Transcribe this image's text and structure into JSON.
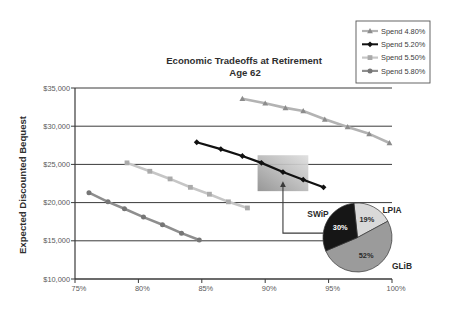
{
  "chart_data": {
    "type": "line",
    "title": "Economic Tradeoffs at Retirement",
    "subtitle": "Age 62",
    "xlabel": "",
    "ylabel": "Expected Discounted Bequest",
    "xlim": [
      75,
      100
    ],
    "ylim": [
      10000,
      35000
    ],
    "xticks": [
      75,
      80,
      85,
      90,
      95,
      100
    ],
    "xtick_labels": [
      "75%",
      "80%",
      "85%",
      "90%",
      "95%",
      "100%"
    ],
    "yticks": [
      10000,
      15000,
      20000,
      25000,
      30000,
      35000
    ],
    "ytick_labels": [
      "$10,000",
      "$15,000",
      "$20,000",
      "$25,000",
      "$30,000",
      "$35,000"
    ],
    "grid": "horizontal",
    "legend_position": "top-right",
    "series": [
      {
        "name": "Spend 4.80%",
        "color": "#b3b3b3",
        "marker_color": "#8c8c8c",
        "marker": "triangle",
        "x": [
          88.2,
          90.0,
          91.6,
          93.0,
          94.7,
          96.5,
          98.2,
          99.8
        ],
        "y": [
          33600,
          33000,
          32400,
          32000,
          30900,
          29900,
          29000,
          27800
        ]
      },
      {
        "name": "Spend 5.20%",
        "color": "#111111",
        "marker_color": "#111111",
        "marker": "diamond",
        "x": [
          84.6,
          86.5,
          88.2,
          89.7,
          91.4,
          93.0,
          94.6
        ],
        "y": [
          27900,
          27000,
          26100,
          25200,
          24000,
          23000,
          22000
        ]
      },
      {
        "name": "Spend 5.50%",
        "color": "#c6c6c6",
        "marker_color": "#aaaaaa",
        "marker": "square",
        "x": [
          79.1,
          80.9,
          82.5,
          84.1,
          85.6,
          87.1,
          88.6
        ],
        "y": [
          25200,
          24100,
          23100,
          22000,
          21100,
          20100,
          19300
        ]
      },
      {
        "name": "Spend 5.80%",
        "color": "#8e8e8e",
        "marker_color": "#767676",
        "marker": "circle",
        "x": [
          76.1,
          77.6,
          78.9,
          80.4,
          81.9,
          83.4,
          84.8
        ],
        "y": [
          21300,
          20100,
          19200,
          18100,
          17100,
          16000,
          15100
        ]
      }
    ],
    "annotations": {
      "highlight_region": {
        "x": [
          89.4,
          93.4
        ],
        "y": [
          21500,
          26200
        ]
      },
      "arrow_path": [
        [
          94.6,
          16000
        ],
        [
          91.4,
          16000
        ],
        [
          91.4,
          22400
        ]
      ]
    },
    "inset_pie": {
      "type": "pie",
      "start_angle_deg": -6,
      "slices": [
        {
          "label": "LPIA",
          "value": 19,
          "value_label": "19%",
          "color": "#d9d9d9",
          "text_color": "#2a2a2a"
        },
        {
          "label": "GLiB",
          "value": 52,
          "value_label": "52%",
          "color": "#9b9b9b",
          "text_color": "#2a2a2a"
        },
        {
          "label": "SWiP",
          "value": 30,
          "value_label": "30%",
          "color": "#161616",
          "text_color": "#ffffff"
        }
      ]
    }
  }
}
